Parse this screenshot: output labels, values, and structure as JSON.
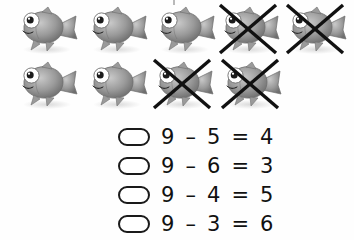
{
  "worksheet": {
    "type": "subtraction-picture-problem",
    "total_objects": 9,
    "crossed_out": 4,
    "remaining": 5,
    "object_name": "fish",
    "rows": [
      {
        "row_index": 1,
        "count": 5,
        "items": [
          {
            "id": "fish-1",
            "crossed_out": false,
            "x": 14
          },
          {
            "id": "fish-2",
            "crossed_out": false,
            "x": 84
          },
          {
            "id": "fish-3",
            "crossed_out": false,
            "x": 152
          },
          {
            "id": "fish-4",
            "crossed_out": true,
            "x": 216
          },
          {
            "id": "fish-5",
            "crossed_out": true,
            "x": 283
          }
        ]
      },
      {
        "row_index": 2,
        "count": 4,
        "items": [
          {
            "id": "fish-6",
            "crossed_out": false,
            "x": 14
          },
          {
            "id": "fish-7",
            "crossed_out": false,
            "x": 84
          },
          {
            "id": "fish-8",
            "crossed_out": true,
            "x": 150
          },
          {
            "id": "fish-9",
            "crossed_out": true,
            "x": 218
          }
        ]
      }
    ]
  },
  "choices": [
    {
      "id": "choice-a",
      "text": "9 – 5 = 4",
      "minuend": 9,
      "subtrahend": 5,
      "result": 4,
      "selected": false
    },
    {
      "id": "choice-b",
      "text": "9 – 6 = 3",
      "minuend": 9,
      "subtrahend": 6,
      "result": 3,
      "selected": false
    },
    {
      "id": "choice-c",
      "text": "9 – 4 = 5",
      "minuend": 9,
      "subtrahend": 4,
      "result": 5,
      "selected": false
    },
    {
      "id": "choice-d",
      "text": "9 – 3 = 6",
      "minuend": 9,
      "subtrahend": 3,
      "result": 6,
      "selected": false
    }
  ],
  "colors": {
    "background": "#ffffff",
    "ink": "#111111",
    "fish_body_light": "#c9c9c9",
    "fish_body_mid": "#9a9a9a",
    "fish_body_dark": "#6e6e6e",
    "fish_eye_white": "#ffffff",
    "fish_eye_pupil": "#1c1c1c",
    "cross_mark": "#111111",
    "shadow": "#d8d8d8"
  }
}
